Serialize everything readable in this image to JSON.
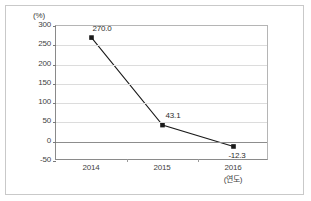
{
  "chart_data": {
    "type": "line",
    "title": "",
    "subtitle": "",
    "xlabel": "(연도)",
    "ylabel": "(%)",
    "categories": [
      "2014",
      "2015",
      "2016"
    ],
    "series": [
      {
        "name": "",
        "values": [
          270.0,
          43.1,
          -12.3
        ],
        "point_labels": [
          "270.0",
          "43.1",
          "-12.3"
        ],
        "marker": "square",
        "marker_color": "#1a1a1a",
        "line_color": "#1a1a1a"
      }
    ],
    "ylim": [
      -50,
      300
    ],
    "ytick_values": [
      300,
      250,
      200,
      150,
      100,
      50,
      0,
      -50
    ],
    "ytick_labels": [
      "300",
      "250",
      "200",
      "150",
      "100",
      "50",
      "0",
      "-50"
    ],
    "grid": true,
    "grid_color": "#dcdcdc",
    "zero_line_color": "#8d8d8d",
    "legend": "none"
  },
  "frame": {
    "border_color": "#c9c9c9",
    "background": "#ffffff"
  },
  "axes": {
    "unit_label": "(%)",
    "x_unit_label": "(연도)",
    "axis_color": "#8a8a8a"
  }
}
